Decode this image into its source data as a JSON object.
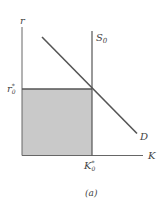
{
  "figure": {
    "caption": "(a)",
    "axes": {
      "y_label": "r",
      "x_label": "K"
    },
    "curves": {
      "supply_label": "S",
      "supply_sub": "0",
      "demand_label": "D"
    },
    "equilibrium": {
      "r_label": "r",
      "r_sup": "*",
      "r_sub": "0",
      "k_label": "K",
      "k_sup": "*",
      "k_sub": "0"
    },
    "colors": {
      "line": "#555555",
      "shade": "#c9c9c9",
      "text": "#444444"
    }
  }
}
